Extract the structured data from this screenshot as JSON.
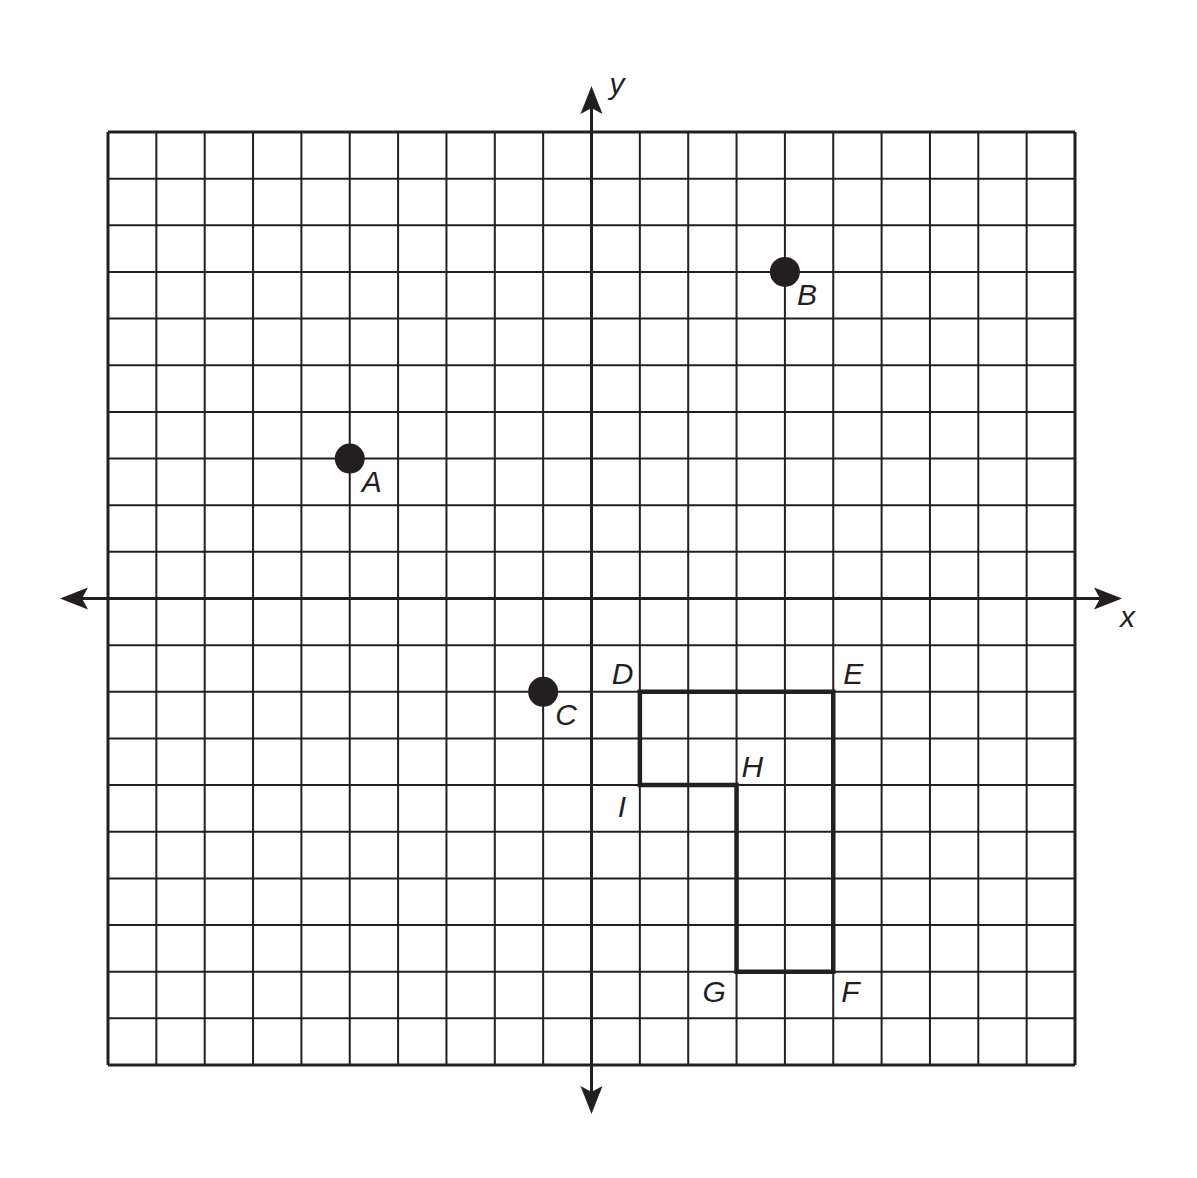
{
  "chart_data": {
    "type": "scatter",
    "title": "",
    "xlabel": "x",
    "ylabel": "y",
    "xlim": [
      -10,
      10
    ],
    "ylim": [
      -10,
      10
    ],
    "grid": true,
    "grid_step": 1,
    "points": [
      {
        "label": "A",
        "x": -5,
        "y": 3
      },
      {
        "label": "B",
        "x": 4,
        "y": 7
      },
      {
        "label": "C",
        "x": -1,
        "y": -2
      }
    ],
    "polygon": {
      "vertices": [
        {
          "label": "D",
          "x": 1,
          "y": -2
        },
        {
          "label": "E",
          "x": 5,
          "y": -2
        },
        {
          "label": "F",
          "x": 5,
          "y": -8
        },
        {
          "label": "G",
          "x": 3,
          "y": -8
        },
        {
          "label": "H",
          "x": 3,
          "y": -4
        },
        {
          "label": "I",
          "x": 1,
          "y": -4
        }
      ]
    }
  },
  "axes": {
    "x_label": "x",
    "y_label": "y"
  },
  "colors": {
    "ink": "#231f20",
    "background": "#ffffff"
  }
}
